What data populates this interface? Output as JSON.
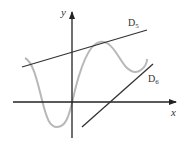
{
  "figure": {
    "axes": {
      "x_label": "x",
      "y_label": "y"
    },
    "lines": [
      {
        "name": "D",
        "subscript": "5",
        "description": "line above curve touching near its peak"
      },
      {
        "name": "D",
        "subscript": "6",
        "description": "line crossing x-axis, touching curve near right"
      }
    ],
    "curve": {
      "description": "oscillating function graph (gray)"
    },
    "colors": {
      "axis": "#222222",
      "line": "#333333",
      "curve": "#b8b8b8",
      "text": "#333333"
    }
  }
}
